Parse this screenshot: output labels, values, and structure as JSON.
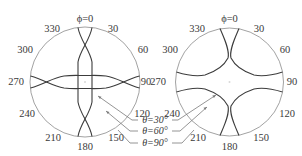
{
  "figure": {
    "left_plot": {
      "angle_labels": {
        "a0": "ϕ=0",
        "a30": "30",
        "a60": "60",
        "a90": "90",
        "a120": "120",
        "a150": "150",
        "a180": "180",
        "a210": "210",
        "a240": "240",
        "a270": "270",
        "a300": "300",
        "a330": "330"
      }
    },
    "right_plot": {
      "angle_labels": {
        "a0": "ϕ=0",
        "a30": "30",
        "a60": "60",
        "a90": "90",
        "a120": "120",
        "a150": "150",
        "a180": "180",
        "a210": "210",
        "a240": "240",
        "a270": "270",
        "a300": "300",
        "a330": "330"
      }
    },
    "legend": {
      "theta30": "θ=30°",
      "theta60": "θ=60°",
      "theta90": "θ=90°"
    },
    "colors": {
      "curve": "#3c3c3c",
      "circle": "#8a8a8a",
      "text": "#3a3a3a"
    }
  }
}
